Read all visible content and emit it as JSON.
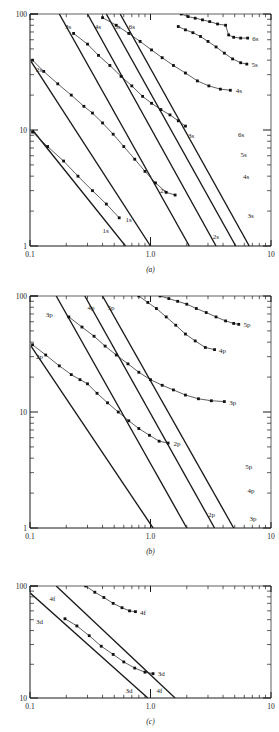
{
  "figure": {
    "title": "",
    "panels": [
      {
        "id": "a",
        "caption": "(a)",
        "ylabel": "Z",
        "x_ticklabels": [
          "0.1",
          "1.0",
          "10"
        ],
        "y_ticklabels": [
          "100",
          "10",
          "1"
        ],
        "xlim": [
          0.1,
          10
        ],
        "ylim": [
          1,
          100
        ],
        "line_labels_top": [
          "3s",
          "4s",
          "5s",
          "6s"
        ],
        "line_labels_left": [
          "2s"
        ],
        "line_labels_right": [
          "6s",
          "5s",
          "4s",
          "3s"
        ],
        "line_labels_bottom": [
          "1s",
          "2s"
        ],
        "curve_labels": [
          "6s",
          "5s",
          "4s",
          "3s",
          "2s",
          "1s"
        ]
      },
      {
        "id": "b",
        "caption": "(b)",
        "ylabel": "Z",
        "x_ticklabels": [
          "0.1",
          "1.0",
          "10"
        ],
        "y_ticklabels": [
          "100",
          "10",
          "1"
        ],
        "xlim": [
          0.1,
          10
        ],
        "ylim": [
          1,
          100
        ],
        "line_labels_top": [
          "3p",
          "4p",
          "5p"
        ],
        "line_labels_left": [
          "2p"
        ],
        "line_labels_right": [
          "5p",
          "4p",
          "3p"
        ],
        "line_labels_bottom": [
          "2p"
        ],
        "curve_labels": [
          "5p",
          "4p",
          "3p",
          "2p"
        ]
      },
      {
        "id": "c",
        "caption": "(c)",
        "ylabel": "Z",
        "x_ticklabels": [
          "0.1",
          "1.0",
          "10"
        ],
        "y_ticklabels": [
          "100",
          "10"
        ],
        "xlim": [
          0.1,
          10
        ],
        "ylim": [
          10,
          100
        ],
        "line_labels_top": [
          "4f"
        ],
        "line_labels_left": [
          "3d"
        ],
        "line_labels_right": [],
        "line_labels_bottom": [
          "3d",
          "4f"
        ],
        "curve_labels": [
          "4f",
          "3d"
        ]
      }
    ]
  },
  "chart_data": {
    "type": "line",
    "title": "",
    "xlabel": "",
    "ylabel": "Z",
    "xscale": "log",
    "yscale": "log",
    "grid": false,
    "legend": "inline-labels",
    "panels": [
      {
        "id": "a",
        "caption": "(a)",
        "xlim": [
          0.1,
          10
        ],
        "ylim": [
          1,
          100
        ],
        "xticks": [
          0.1,
          1.0,
          10
        ],
        "xticklabels": [
          "0.1",
          "1.0",
          "10"
        ],
        "yticks": [
          1,
          10,
          100
        ],
        "yticklabels": [
          "1",
          "10",
          "100"
        ],
        "reference_lines": [
          {
            "name": "1s",
            "x": [
              0.105,
              0.62
            ],
            "y": [
              10.0,
              1.0
            ]
          },
          {
            "name": "2s",
            "x": [
              0.102,
              1.0
            ],
            "y": [
              39.0,
              1.0
            ]
          },
          {
            "name": "3s",
            "x": [
              0.175,
              2.1
            ],
            "y": [
              100.0,
              1.0
            ]
          },
          {
            "name": "4s",
            "x": [
              0.3,
              3.5
            ],
            "y": [
              100.0,
              1.0
            ]
          },
          {
            "name": "5s",
            "x": [
              0.43,
              5.1
            ],
            "y": [
              100.0,
              1.0
            ]
          },
          {
            "name": "6s",
            "x": [
              0.56,
              6.6
            ],
            "y": [
              100.0,
              1.0
            ]
          }
        ],
        "series": [
          {
            "name": "1s",
            "x": [
              0.105,
              0.14,
              0.19,
              0.25,
              0.33,
              0.43,
              0.55
            ],
            "y": [
              9.6,
              7.2,
              5.4,
              4.0,
              3.0,
              2.3,
              1.75
            ]
          },
          {
            "name": "2s",
            "x": [
              0.105,
              0.13,
              0.17,
              0.22,
              0.28,
              0.33,
              0.4,
              0.49,
              0.6,
              0.74,
              0.9,
              1.1,
              1.35,
              1.6
            ],
            "y": [
              40.0,
              32.0,
              25.0,
              20.0,
              16.0,
              14.0,
              11.5,
              9.2,
              7.2,
              5.6,
              4.4,
              3.5,
              2.9,
              2.75
            ]
          },
          {
            "name": "3s",
            "x": [
              0.23,
              0.3,
              0.37,
              0.46,
              0.57,
              0.7,
              0.86,
              1.02,
              1.22,
              1.45,
              1.7,
              1.95
            ],
            "y": [
              68.0,
              55.0,
              44.0,
              36.0,
              29.0,
              24.0,
              19.5,
              17.0,
              15.0,
              13.5,
              12.0,
              10.8
            ]
          },
          {
            "name": "4s",
            "x": [
              0.4,
              0.52,
              0.66,
              0.82,
              1.02,
              1.25,
              1.55,
              1.95,
              2.45,
              3.05,
              3.8,
              4.6
            ],
            "y": [
              93.0,
              80.0,
              68.0,
              58.0,
              49.0,
              42.0,
              36.0,
              31.0,
              26.5,
              24.0,
              22.5,
              22.0
            ]
          },
          {
            "name": "5s",
            "x": [
              1.7,
              1.95,
              2.25,
              2.6,
              3.0,
              3.5,
              4.1,
              4.8,
              5.6,
              6.3
            ],
            "y": [
              78.0,
              73.0,
              69.0,
              64.0,
              58.0,
              52.0,
              46.0,
              41.0,
              38.0,
              37.0
            ]
          },
          {
            "name": "6s",
            "x": [
              1.8,
              2.05,
              2.35,
              2.7,
              3.1,
              3.6,
              4.2,
              4.45,
              4.9,
              5.6,
              6.4
            ],
            "y": [
              100.0,
              95.0,
              92.0,
              89.0,
              86.0,
              82.0,
              80.0,
              66.0,
              63.0,
              62.0,
              62.0
            ]
          }
        ]
      },
      {
        "id": "b",
        "caption": "(b)",
        "xlim": [
          0.1,
          10
        ],
        "ylim": [
          1,
          100
        ],
        "xticks": [
          0.1,
          1.0,
          10
        ],
        "xticklabels": [
          "0.1",
          "1.0",
          "10"
        ],
        "yticks": [
          1,
          10,
          100
        ],
        "yticklabels": [
          "1",
          "10",
          "100"
        ],
        "reference_lines": [
          {
            "name": "2p",
            "x": [
              0.102,
              1.05
            ],
            "y": [
              37.0,
              1.0
            ]
          },
          {
            "name": "3p",
            "x": [
              0.165,
              2.0
            ],
            "y": [
              100.0,
              1.0
            ]
          },
          {
            "name": "4p",
            "x": [
              0.285,
              3.4
            ],
            "y": [
              100.0,
              1.0
            ]
          },
          {
            "name": "5p",
            "x": [
              0.4,
              4.9
            ],
            "y": [
              100.0,
              1.0
            ]
          }
        ],
        "series": [
          {
            "name": "2p",
            "x": [
              0.105,
              0.135,
              0.175,
              0.22,
              0.26,
              0.3,
              0.36,
              0.44,
              0.54,
              0.66,
              0.8,
              0.98,
              1.18,
              1.4
            ],
            "y": [
              38.0,
              31.0,
              25.0,
              21.0,
              19.0,
              17.5,
              14.5,
              12.0,
              10.0,
              8.4,
              7.2,
              6.3,
              5.6,
              5.4
            ]
          },
          {
            "name": "3p",
            "x": [
              0.21,
              0.27,
              0.34,
              0.42,
              0.52,
              0.65,
              0.8,
              1.0,
              1.25,
              1.55,
              1.95,
              2.5,
              3.2,
              4.1
            ],
            "y": [
              66.0,
              54.0,
              45.0,
              37.0,
              31.0,
              26.0,
              22.0,
              19.0,
              17.0,
              15.5,
              14.0,
              13.0,
              12.5,
              12.3
            ]
          },
          {
            "name": "4p",
            "x": [
              0.8,
              0.95,
              1.12,
              1.35,
              1.62,
              1.95,
              2.35,
              2.85,
              3.4
            ],
            "y": [
              100.0,
              88.0,
              78.0,
              66.0,
              56.0,
              47.0,
              41.0,
              36.0,
              34.5
            ]
          },
          {
            "name": "5p",
            "x": [
              1.2,
              1.42,
              1.68,
              2.0,
              2.4,
              2.9,
              3.5,
              4.2,
              4.9,
              5.4
            ],
            "y": [
              100.0,
              95.0,
              90.0,
              85.0,
              78.0,
              72.0,
              66.0,
              61.0,
              58.0,
              57.0
            ]
          }
        ]
      },
      {
        "id": "c",
        "caption": "(c)",
        "xlim": [
          0.1,
          10
        ],
        "ylim": [
          10,
          100
        ],
        "xticks": [
          0.1,
          1.0,
          10
        ],
        "xticklabels": [
          "0.1",
          "1.0",
          "10"
        ],
        "yticks": [
          10,
          100
        ],
        "yticklabels": [
          "10",
          "100"
        ],
        "reference_lines": [
          {
            "name": "3d",
            "x": [
              0.1,
              0.95
            ],
            "y": [
              87.0,
              10.0
            ]
          },
          {
            "name": "4f",
            "x": [
              0.165,
              1.6
            ],
            "y": [
              100.0,
              10.0
            ]
          }
        ],
        "series": [
          {
            "name": "3d",
            "x": [
              0.195,
              0.245,
              0.31,
              0.39,
              0.49,
              0.6,
              0.74,
              0.9,
              1.05
            ],
            "y": [
              51.0,
              44.0,
              36.0,
              29.0,
              24.5,
              21.0,
              18.5,
              17.0,
              16.5
            ]
          },
          {
            "name": "4f",
            "x": [
              0.29,
              0.345,
              0.41,
              0.49,
              0.58,
              0.67,
              0.75
            ],
            "y": [
              100.0,
              88.0,
              79.0,
              70.0,
              64.0,
              60.0,
              59.0
            ]
          }
        ]
      }
    ]
  }
}
